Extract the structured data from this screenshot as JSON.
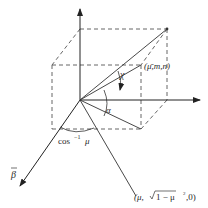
{
  "diagram": {
    "type": "3d-direction-cosine-geometry",
    "labels": {
      "point_top": "(μ̄,m,n)",
      "chi": "χ",
      "alpha": "α",
      "arccos": "cos",
      "arccos_exp": "−1",
      "arccos_arg": "μ",
      "beta_axis": "β",
      "point_bottom_prefix": "(μ,",
      "point_bottom_sqrt": "1 − μ",
      "point_bottom_sq": "2",
      "point_bottom_suffix": ",0)"
    },
    "colors": {
      "line": "#333333",
      "dashed": "#555555",
      "text": "#2a2a2a"
    }
  }
}
